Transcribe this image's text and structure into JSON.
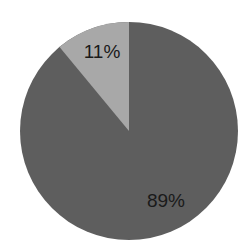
{
  "chart_data": {
    "type": "pie",
    "title": "",
    "categories": [
      "Slice A",
      "Slice B"
    ],
    "values": [
      89,
      11
    ],
    "labels": [
      "89%",
      "11%"
    ],
    "colors": [
      "#5e5e5e",
      "#a8a8a8"
    ],
    "start_angle": "12 o'clock, clockwise",
    "legend": "none"
  },
  "labels": {
    "large": "89%",
    "small": "11%"
  }
}
